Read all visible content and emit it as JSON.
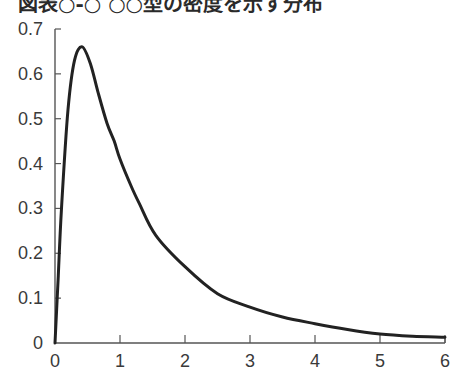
{
  "title": "図表○-○ ○○型の密度を示す分布",
  "chart_data": {
    "type": "line",
    "title": "図表○-○ ○○型の密度を示す分布",
    "xlabel": "",
    "ylabel": "",
    "xlim": [
      0,
      6
    ],
    "ylim": [
      0,
      0.7
    ],
    "grid": false,
    "legend": null,
    "x_ticks": [
      "0",
      "1",
      "2",
      "3",
      "4",
      "5",
      "6"
    ],
    "y_ticks": [
      "0",
      "0.1",
      "0.2",
      "0.3",
      "0.4",
      "0.5",
      "0.6",
      "0.7"
    ],
    "series": [
      {
        "name": "density",
        "color": "#222222",
        "x": [
          0,
          0.05,
          0.1,
          0.2,
          0.3,
          0.42,
          0.55,
          0.66,
          0.8,
          0.91,
          1.0,
          1.17,
          1.3,
          1.55,
          2.0,
          2.5,
          3.0,
          3.5,
          4.0,
          4.5,
          5.0,
          5.5,
          6.0
        ],
        "y": [
          0,
          0.15,
          0.3,
          0.52,
          0.63,
          0.66,
          0.62,
          0.56,
          0.49,
          0.45,
          0.41,
          0.35,
          0.31,
          0.24,
          0.17,
          0.11,
          0.08,
          0.058,
          0.043,
          0.03,
          0.02,
          0.015,
          0.013
        ]
      }
    ]
  }
}
